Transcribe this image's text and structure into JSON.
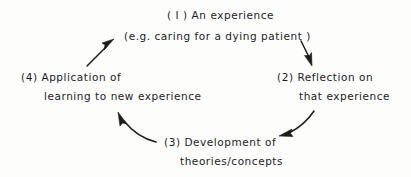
{
  "figure": {
    "background_color": "#fdfdfc",
    "ink_color": "#1c1c1c",
    "stages": [
      {
        "number": "(1)",
        "position": "top",
        "line1": "( I ) An experience",
        "line2": "(e.g. caring for a dying patient )"
      },
      {
        "number": "(2)",
        "position": "right",
        "line1": "(2) Reflection on",
        "line2": "that experience"
      },
      {
        "number": "(3)",
        "position": "bottom",
        "line1": "(3) Development of",
        "line2": "theories/concepts"
      },
      {
        "number": "(4)",
        "position": "left",
        "line1": "(4) Application of",
        "line2": "learning to new experience"
      }
    ],
    "arrows": [
      {
        "name": "arrow-stage1-to-stage2",
        "from": "(1) An experience",
        "to": "(2) Reflection on that experience",
        "direction": "down-right"
      },
      {
        "name": "arrow-stage2-to-stage3",
        "from": "(2) Reflection on that experience",
        "to": "(3) Development of theories/concepts",
        "direction": "down-left"
      },
      {
        "name": "arrow-stage3-to-stage4",
        "from": "(3) Development of theories/concepts",
        "to": "(4) Application of learning to new experience",
        "direction": "up-left"
      },
      {
        "name": "arrow-stage4-to-stage1",
        "from": "(4) Application of learning to new experience",
        "to": "(1) An experience",
        "direction": "up-right"
      }
    ]
  }
}
